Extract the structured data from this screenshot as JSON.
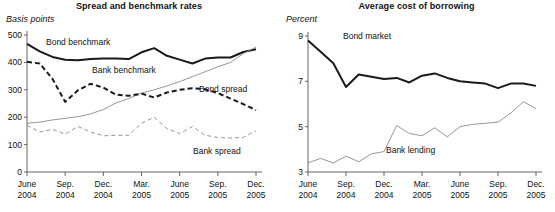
{
  "figure": {
    "panels": [
      {
        "id": "spread-and-benchmark-rates",
        "title": "Spread and benchmark rates",
        "unit": "Basis points"
      },
      {
        "id": "average-cost-of-borrowing",
        "title": "Average cost of borrowing",
        "unit": "Percent"
      }
    ]
  },
  "chart_data": [
    {
      "type": "line",
      "title": "Spread and benchmark rates",
      "xlabel": "",
      "ylabel": "Basis points",
      "ylim": [
        0,
        500
      ],
      "yticks": [
        0,
        100,
        200,
        300,
        400,
        500
      ],
      "ytick_labels": [
        "0",
        "100",
        "200",
        "300",
        "400",
        "500"
      ],
      "grid": false,
      "legend": "inline-annotations",
      "x": [
        "June 2004",
        "July 2004",
        "Aug. 2004",
        "Sep. 2004",
        "Oct. 2004",
        "Nov. 2004",
        "Dec. 2004",
        "Jan. 2005",
        "Feb. 2005",
        "Mar. 2005",
        "Apr. 2005",
        "May 2005",
        "June 2005",
        "July 2005",
        "Aug. 2005",
        "Sep. 2005",
        "Oct. 2005",
        "Nov. 2005",
        "Dec. 2005"
      ],
      "xtick_labels": [
        {
          "line1": "June",
          "line2": "2004"
        },
        {
          "line1": "Sep.",
          "line2": "2004"
        },
        {
          "line1": "Dec.",
          "line2": "2004"
        },
        {
          "line1": "Mar.",
          "line2": "2005"
        },
        {
          "line1": "June",
          "line2": "2005"
        },
        {
          "line1": "Sep.",
          "line2": "2005"
        },
        {
          "line1": "Dec.",
          "line2": "2005"
        }
      ],
      "xtick_indices": [
        0,
        3,
        6,
        9,
        12,
        15,
        18
      ],
      "series": [
        {
          "name": "Bond benchmark",
          "style": "solid-thick-black",
          "color": "#1a1a1a",
          "values": [
            468,
            440,
            420,
            410,
            408,
            412,
            414,
            414,
            412,
            437,
            452,
            424,
            410,
            396,
            414,
            418,
            418,
            438,
            448
          ]
        },
        {
          "name": "Bank benchmark",
          "style": "solid-thin-gray",
          "color": "#8a8a8a",
          "values": [
            178,
            182,
            190,
            196,
            202,
            212,
            228,
            252,
            268,
            288,
            300,
            314,
            330,
            348,
            366,
            384,
            400,
            432,
            456
          ]
        },
        {
          "name": "Bond spread",
          "style": "dashed-thick-black",
          "color": "#1a1a1a",
          "values": [
            402,
            396,
            340,
            256,
            298,
            322,
            308,
            282,
            278,
            286,
            272,
            290,
            300,
            306,
            302,
            288,
            268,
            248,
            226
          ]
        },
        {
          "name": "Bank spread",
          "style": "dashed-thin-gray",
          "color": "#8a8a8a",
          "values": [
            170,
            146,
            156,
            138,
            166,
            146,
            132,
            134,
            134,
            178,
            200,
            158,
            140,
            166,
            134,
            126,
            124,
            126,
            150
          ]
        }
      ]
    },
    {
      "type": "line",
      "title": "Average cost of borrowing",
      "xlabel": "",
      "ylabel": "Percent",
      "ylim": [
        3,
        9
      ],
      "yticks": [
        3,
        5,
        7,
        9
      ],
      "ytick_labels": [
        "3",
        "5",
        "7",
        "9"
      ],
      "grid": false,
      "legend": "inline-annotations",
      "x": [
        "June 2004",
        "July 2004",
        "Aug. 2004",
        "Sep. 2004",
        "Oct. 2004",
        "Nov. 2004",
        "Dec. 2004",
        "Jan. 2005",
        "Feb. 2005",
        "Mar. 2005",
        "Apr. 2005",
        "May 2005",
        "June 2005",
        "July 2005",
        "Aug. 2005",
        "Sep. 2005",
        "Oct. 2005",
        "Nov. 2005",
        "Dec. 2005"
      ],
      "xtick_labels": [
        {
          "line1": "June",
          "line2": "2004"
        },
        {
          "line1": "Sep.",
          "line2": "2004"
        },
        {
          "line1": "Dec.",
          "line2": "2004"
        },
        {
          "line1": "Mar.",
          "line2": "2005"
        },
        {
          "line1": "June",
          "line2": "2005"
        },
        {
          "line1": "Sep.",
          "line2": "2005"
        },
        {
          "line1": "Dec.",
          "line2": "2005"
        }
      ],
      "xtick_indices": [
        0,
        3,
        6,
        9,
        12,
        15,
        18
      ],
      "series": [
        {
          "name": "Bond market",
          "style": "solid-thick-black",
          "color": "#1a1a1a",
          "values": [
            8.8,
            8.3,
            7.8,
            6.75,
            7.3,
            7.2,
            7.1,
            7.15,
            6.95,
            7.25,
            7.35,
            7.15,
            7.0,
            6.95,
            6.9,
            6.7,
            6.9,
            6.9,
            6.8
          ]
        },
        {
          "name": "Bank lending",
          "style": "solid-thin-gray",
          "color": "#8a8a8a",
          "values": [
            3.4,
            3.6,
            3.4,
            3.7,
            3.45,
            3.8,
            3.9,
            5.05,
            4.7,
            4.6,
            4.95,
            4.55,
            5.0,
            5.1,
            5.15,
            5.2,
            5.6,
            6.1,
            5.8
          ]
        }
      ]
    }
  ],
  "annotations": {
    "left": [
      {
        "text": "Bond benchmark",
        "x": 46,
        "y": 45
      },
      {
        "text": "Bank benchmark",
        "x": 92,
        "y": 73
      },
      {
        "text": "Bond spread",
        "x": 199,
        "y": 92
      },
      {
        "text": "Bank spread",
        "x": 193,
        "y": 154
      }
    ],
    "right": [
      {
        "text": "Bond market",
        "x": 65,
        "y": 39
      },
      {
        "text": "Bank lending",
        "x": 108,
        "y": 153
      }
    ]
  }
}
